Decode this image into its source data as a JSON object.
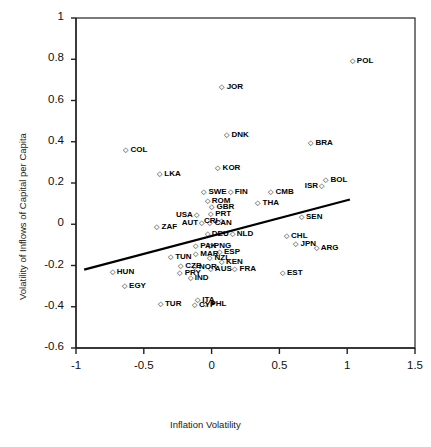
{
  "chart_data": {
    "type": "scatter",
    "title": "",
    "xlabel": "Inflation Volatility",
    "ylabel": "Volatility of Inflows of Capital per Capita",
    "xlim": [
      -1,
      1.5
    ],
    "ylim": [
      -0.6,
      1
    ],
    "xticks": [
      "-1",
      "-0.5",
      "0",
      "0.5",
      "1",
      "1.5"
    ],
    "yticks": [
      "1",
      "0.8",
      "0.6",
      "0.4",
      "0.2",
      "0",
      "-0.2",
      "-0.4",
      "-0.6"
    ],
    "grid": false,
    "legend": "none",
    "marker": "open-diamond",
    "trendline": {
      "x0": -0.94,
      "y0": -0.22,
      "x1": 1.02,
      "y1": 0.12
    },
    "points": [
      {
        "label": "POL",
        "x": 1.04,
        "y": 0.79,
        "side": "right"
      },
      {
        "label": "JOR",
        "x": 0.08,
        "y": 0.665,
        "side": "right"
      },
      {
        "label": "DNK",
        "x": 0.115,
        "y": 0.435,
        "side": "right"
      },
      {
        "label": "BRA",
        "x": 0.735,
        "y": 0.395,
        "side": "right"
      },
      {
        "label": "COL",
        "x": -0.63,
        "y": 0.36,
        "side": "right"
      },
      {
        "label": "KOR",
        "x": 0.05,
        "y": 0.275,
        "side": "right"
      },
      {
        "label": "LKA",
        "x": -0.38,
        "y": 0.245,
        "side": "right"
      },
      {
        "label": "BOL",
        "x": 0.845,
        "y": 0.215,
        "side": "right"
      },
      {
        "label": "ISR",
        "x": 0.79,
        "y": 0.185,
        "side": "left"
      },
      {
        "label": "SWE",
        "x": -0.055,
        "y": 0.155,
        "side": "right"
      },
      {
        "label": "FIN",
        "x": 0.14,
        "y": 0.155,
        "side": "right"
      },
      {
        "label": "CMB",
        "x": 0.44,
        "y": 0.155,
        "side": "right"
      },
      {
        "label": "ROM",
        "x": -0.03,
        "y": 0.115,
        "side": "right"
      },
      {
        "label": "THA",
        "x": 0.345,
        "y": 0.105,
        "side": "right"
      },
      {
        "label": "GBR",
        "x": 0.005,
        "y": 0.085,
        "side": "right"
      },
      {
        "label": "PRT",
        "x": -0.005,
        "y": 0.05,
        "side": "right"
      },
      {
        "label": "USA",
        "x": -0.13,
        "y": 0.045,
        "side": "left"
      },
      {
        "label": "SEN",
        "x": 0.665,
        "y": 0.035,
        "side": "right"
      },
      {
        "label": "AUT",
        "x": -0.095,
        "y": 0.005,
        "side": "left"
      },
      {
        "label": "CAN",
        "x": -0.01,
        "y": 0.005,
        "side": "right"
      },
      {
        "label": "CRI",
        "x": 0.055,
        "y": 0.015,
        "side": "left"
      },
      {
        "label": "ZAF",
        "x": -0.4,
        "y": -0.015,
        "side": "right"
      },
      {
        "label": "DEU",
        "x": -0.03,
        "y": -0.045,
        "side": "right"
      },
      {
        "label": "NLD",
        "x": 0.155,
        "y": -0.045,
        "side": "right"
      },
      {
        "label": "CHL",
        "x": 0.555,
        "y": -0.055,
        "side": "right"
      },
      {
        "label": "JPN",
        "x": 0.625,
        "y": -0.095,
        "side": "right"
      },
      {
        "label": "ARG",
        "x": 0.775,
        "y": -0.115,
        "side": "right"
      },
      {
        "label": "PAK",
        "x": -0.115,
        "y": -0.105,
        "side": "right"
      },
      {
        "label": "PNG",
        "x": -0.015,
        "y": -0.105,
        "side": "right"
      },
      {
        "label": "MAR",
        "x": -0.115,
        "y": -0.145,
        "side": "right"
      },
      {
        "label": "ESP",
        "x": 0.06,
        "y": -0.135,
        "side": "right"
      },
      {
        "label": "NZL",
        "x": -0.01,
        "y": -0.165,
        "side": "right"
      },
      {
        "label": "TUN",
        "x": -0.3,
        "y": -0.16,
        "side": "right"
      },
      {
        "label": "KEN",
        "x": 0.075,
        "y": -0.185,
        "side": "right"
      },
      {
        "label": "CZE",
        "x": -0.225,
        "y": -0.2,
        "side": "right"
      },
      {
        "label": "NOR",
        "x": -0.125,
        "y": -0.205,
        "side": "right"
      },
      {
        "label": "AUS",
        "x": -0.005,
        "y": -0.215,
        "side": "right"
      },
      {
        "label": "FRA",
        "x": 0.175,
        "y": -0.215,
        "side": "right"
      },
      {
        "label": "HUN",
        "x": -0.73,
        "y": -0.23,
        "side": "right"
      },
      {
        "label": "PRY",
        "x": -0.23,
        "y": -0.235,
        "side": "right"
      },
      {
        "label": "IND",
        "x": -0.155,
        "y": -0.26,
        "side": "right"
      },
      {
        "label": "EST",
        "x": 0.525,
        "y": -0.235,
        "side": "right"
      },
      {
        "label": "EGY",
        "x": -0.64,
        "y": -0.3,
        "side": "right"
      },
      {
        "label": "TUR",
        "x": -0.375,
        "y": -0.385,
        "side": "right"
      },
      {
        "label": "ITA",
        "x": -0.1,
        "y": -0.365,
        "side": "right"
      },
      {
        "label": "CYP",
        "x": -0.125,
        "y": -0.39,
        "side": "right"
      },
      {
        "label": "PHL",
        "x": -0.04,
        "y": -0.385,
        "side": "right"
      }
    ]
  },
  "marker_glyph": "◇"
}
